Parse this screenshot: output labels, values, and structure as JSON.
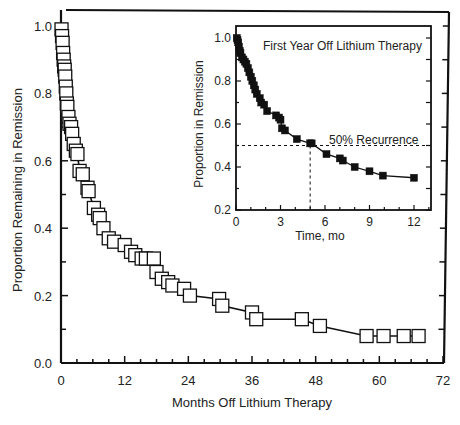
{
  "chart_data": [
    {
      "type": "line",
      "title": "",
      "xlabel": "Months Off Lithium Therapy",
      "ylabel": "Proportion Remaining in Remission",
      "xlim": [
        0,
        72
      ],
      "ylim": [
        0.0,
        1.0
      ],
      "xticks": [
        0,
        12,
        24,
        36,
        48,
        60,
        72
      ],
      "xtick_labels": [
        "0",
        "12",
        "24",
        "36",
        "48",
        "60",
        "72"
      ],
      "yticks": [
        0.0,
        0.2,
        0.4,
        0.6,
        0.8,
        1.0
      ],
      "ytick_labels": [
        "0.0",
        "0.2",
        "0.4",
        "0.6",
        "0.8",
        "1.0"
      ],
      "grid": false,
      "marker": "open-square",
      "series": [
        {
          "name": "Proportion remaining in remission",
          "x": [
            0.1,
            0.2,
            0.3,
            0.4,
            0.5,
            0.6,
            0.7,
            0.8,
            0.9,
            1.0,
            1.1,
            1.2,
            1.4,
            1.6,
            1.9,
            2.1,
            2.4,
            2.8,
            3.1,
            3.5,
            4.1,
            5.0,
            5.2,
            6.2,
            7.0,
            7.3,
            8.0,
            9.0,
            10.0,
            12.0,
            13.2,
            14.0,
            15.2,
            16.0,
            17.5,
            18.0,
            19.0,
            20.2,
            21.0,
            23.2,
            24.3,
            29.8,
            30.4,
            36.0,
            36.8,
            45.4,
            48.8,
            57.6,
            60.8,
            64.6,
            67.4
          ],
          "values": [
            0.99,
            0.97,
            0.95,
            0.92,
            0.9,
            0.88,
            0.87,
            0.85,
            0.82,
            0.8,
            0.77,
            0.76,
            0.73,
            0.71,
            0.7,
            0.68,
            0.65,
            0.63,
            0.62,
            0.57,
            0.56,
            0.52,
            0.51,
            0.46,
            0.44,
            0.43,
            0.4,
            0.37,
            0.36,
            0.35,
            0.33,
            0.32,
            0.31,
            0.31,
            0.31,
            0.27,
            0.25,
            0.24,
            0.23,
            0.22,
            0.2,
            0.19,
            0.17,
            0.15,
            0.13,
            0.13,
            0.11,
            0.08,
            0.08,
            0.08,
            0.08
          ]
        }
      ]
    },
    {
      "type": "line",
      "title": "First Year Off Lithium Therapy",
      "xlabel": "Time, mo",
      "ylabel": "Proportion in Remission",
      "xlim": [
        0,
        13
      ],
      "ylim": [
        0.2,
        1.05
      ],
      "xticks": [
        0,
        3,
        6,
        9,
        12
      ],
      "xtick_labels": [
        "0",
        "3",
        "6",
        "9",
        "12"
      ],
      "yticks": [
        0.2,
        0.4,
        0.6,
        0.8,
        1.0
      ],
      "ytick_labels": [
        "0.2",
        "0.4",
        "0.6",
        "0.8",
        "1.0"
      ],
      "grid": false,
      "marker": "filled-square",
      "annotations": [
        {
          "text": "50% Recurrence",
          "type": "dashed-reference-line",
          "y": 0.5,
          "x_at_50pct": 5.0
        }
      ],
      "series": [
        {
          "name": "Proportion in remission (first year)",
          "x": [
            0.05,
            0.1,
            0.15,
            0.2,
            0.25,
            0.3,
            0.4,
            0.5,
            0.6,
            0.7,
            0.8,
            0.9,
            1.0,
            1.1,
            1.2,
            1.3,
            1.4,
            1.6,
            1.7,
            1.9,
            2.1,
            2.7,
            2.9,
            3.0,
            3.1,
            3.3,
            4.1,
            5.0,
            5.1,
            6.1,
            7.0,
            7.2,
            8.0,
            9.0,
            9.9,
            12.0
          ],
          "values": [
            1.0,
            0.99,
            0.98,
            0.96,
            0.94,
            0.93,
            0.91,
            0.9,
            0.89,
            0.88,
            0.86,
            0.84,
            0.82,
            0.8,
            0.78,
            0.76,
            0.74,
            0.72,
            0.7,
            0.69,
            0.66,
            0.64,
            0.63,
            0.62,
            0.58,
            0.57,
            0.53,
            0.51,
            0.51,
            0.46,
            0.44,
            0.43,
            0.4,
            0.38,
            0.36,
            0.35
          ]
        }
      ]
    }
  ],
  "main": {
    "xlabel": "Months Off Lithium Therapy",
    "ylabel": "Proportion Remaining in Remission",
    "xtick_labels": [
      "0",
      "12",
      "24",
      "36",
      "48",
      "60",
      "72"
    ],
    "ytick_labels": [
      "0.0",
      "0.2",
      "0.4",
      "0.6",
      "0.8",
      "1.0"
    ]
  },
  "inset": {
    "title": "First Year Off Lithium Therapy",
    "xlabel": "Time, mo",
    "ylabel": "Proportion in Remission",
    "annotation": "50% Recurrence",
    "xtick_labels": [
      "0",
      "3",
      "6",
      "9",
      "12"
    ],
    "ytick_labels": [
      "0.2",
      "0.4",
      "0.6",
      "0.8",
      "1.0"
    ]
  }
}
